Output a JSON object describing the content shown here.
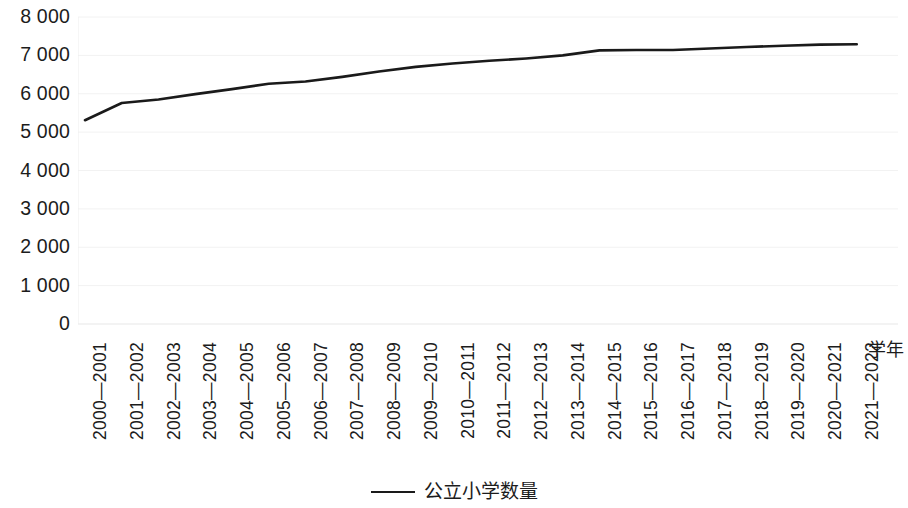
{
  "chart_data": {
    "type": "line",
    "title": "",
    "subtitle": "",
    "xlabel": "学年",
    "ylabel": "",
    "grid": true,
    "grid_axis": "y",
    "legend_position": "bottom",
    "line_color": "#1a1a1a",
    "categories": [
      "2000—2001",
      "2001—2002",
      "2002—2003",
      "2003—2004",
      "2004—2005",
      "2005—2006",
      "2006—2007",
      "2007—2008",
      "2008—2009",
      "2009—2010",
      "2010—2011",
      "2011—2012",
      "2012—2013",
      "2013—2014",
      "2014—2015",
      "2015—2016",
      "2016—2017",
      "2017—2018",
      "2018—2019",
      "2019—2020",
      "2020—2021",
      "2021—2022"
    ],
    "series": [
      {
        "name": "公立小学数量",
        "values": [
          5310,
          5760,
          5850,
          5990,
          6120,
          6260,
          6320,
          6440,
          6580,
          6700,
          6790,
          6860,
          6920,
          7000,
          7130,
          7140,
          7140,
          7180,
          7220,
          7250,
          7280,
          7290
        ]
      }
    ],
    "ylim": [
      0,
      8000
    ],
    "ytick_values": [
      8000,
      7000,
      6000,
      5000,
      4000,
      3000,
      2000,
      1000,
      0
    ],
    "ytick_labels": [
      "8 000",
      "7 000",
      "6 000",
      "5 000",
      "4 000",
      "3 000",
      "2 000",
      "1 000",
      "0"
    ]
  },
  "legend": {
    "entries": [
      {
        "label": "公立小学数量",
        "marker": "line-marker"
      }
    ]
  },
  "axes": {
    "x_title": "学年"
  }
}
